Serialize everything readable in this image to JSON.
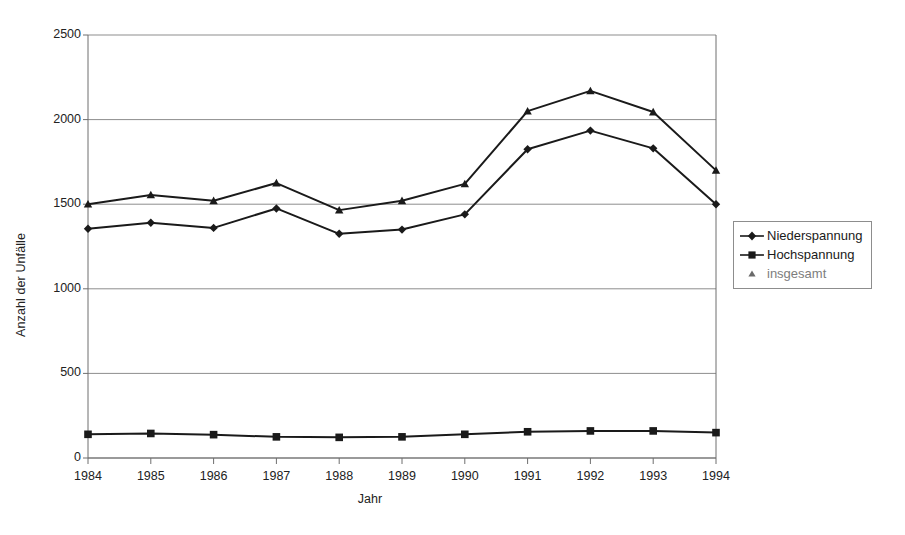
{
  "chart_data": {
    "type": "line",
    "title": "",
    "xlabel": "Jahr",
    "ylabel": "Anzahl der Unfälle",
    "categories": [
      "1984",
      "1985",
      "1986",
      "1987",
      "1988",
      "1989",
      "1990",
      "1991",
      "1992",
      "1993",
      "1994"
    ],
    "x": [
      1984,
      1985,
      1986,
      1987,
      1988,
      1989,
      1990,
      1991,
      1992,
      1993,
      1994
    ],
    "ylim": [
      0,
      2500
    ],
    "yticks": [
      0,
      500,
      1000,
      1500,
      2000,
      2500
    ],
    "ytick_labels": [
      "0",
      "500",
      "1000",
      "1500",
      "2000",
      "2500"
    ],
    "grid": "horizontal",
    "legend_position": "right",
    "series": [
      {
        "name": "Niederspannung",
        "marker": "diamond",
        "values": [
          1355,
          1390,
          1360,
          1475,
          1325,
          1350,
          1440,
          1825,
          1935,
          1830,
          1500
        ]
      },
      {
        "name": "Hochspannung",
        "marker": "square",
        "values": [
          140,
          145,
          138,
          125,
          122,
          125,
          140,
          155,
          160,
          160,
          150
        ]
      },
      {
        "name": "insgesamt",
        "marker": "triangle",
        "values": [
          1500,
          1555,
          1520,
          1625,
          1465,
          1520,
          1620,
          2050,
          2170,
          2045,
          1700
        ]
      }
    ]
  },
  "legend": {
    "items": [
      {
        "label": "Niederspannung",
        "marker": "diamond",
        "faded": false
      },
      {
        "label": "Hochspannung",
        "marker": "square",
        "faded": false
      },
      {
        "label": "insgesamt",
        "marker": "triangle",
        "faded": true
      }
    ]
  },
  "axes": {
    "y_title": "Anzahl der Unfälle",
    "x_title": "Jahr",
    "y_ticks": [
      "2500",
      "2000",
      "1500",
      "1000",
      "500",
      "0"
    ],
    "x_ticks": [
      "1984",
      "1985",
      "1986",
      "1987",
      "1988",
      "1989",
      "1990",
      "1991",
      "1992",
      "1993",
      "1994"
    ]
  },
  "colors": {
    "line": "#1a1a1a",
    "grid": "#8d8d8d",
    "axis": "#6f6f6f",
    "background": "#ffffff"
  }
}
